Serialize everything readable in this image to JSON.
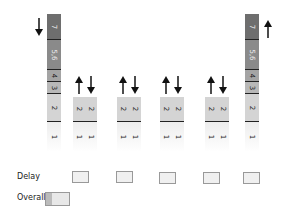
{
  "left_column": {
    "direction": "down",
    "segments": [
      {
        "label": "7",
        "color": "#6e6e6e",
        "top": 14,
        "height": 26
      },
      {
        "label": "5,6",
        "color": "#8a8a8a",
        "top": 40,
        "height": 30
      },
      {
        "label": "4",
        "color": "#a4a4a4",
        "top": 70,
        "height": 12
      },
      {
        "label": "3",
        "color": "#b8b8b8",
        "top": 82,
        "height": 12
      },
      {
        "label": "2",
        "color": "#d4d4d4",
        "top": 94,
        "height": 28
      },
      {
        "label": "1",
        "color": "#ededed",
        "top": 122,
        "height": 30
      }
    ]
  },
  "pairs": [
    {
      "x": 73,
      "labels_top": [
        "2",
        "2"
      ],
      "labels_bottom": [
        "1",
        "1"
      ]
    },
    {
      "x": 117,
      "labels_top": [
        "2",
        "2"
      ],
      "labels_bottom": [
        "1",
        "1"
      ]
    },
    {
      "x": 160,
      "labels_top": [
        "2",
        "2"
      ],
      "labels_bottom": [
        "1",
        "1"
      ]
    },
    {
      "x": 205,
      "labels_top": [
        "2",
        "2"
      ],
      "labels_bottom": [
        "1",
        "1"
      ]
    }
  ],
  "right_column": {
    "direction": "up",
    "segments": [
      {
        "label": "7",
        "color": "#6e6e6e",
        "top": 14,
        "height": 26
      },
      {
        "label": "5,6",
        "color": "#8a8a8a",
        "top": 40,
        "height": 30
      },
      {
        "label": "4",
        "color": "#a4a4a4",
        "top": 70,
        "height": 12
      },
      {
        "label": "3",
        "color": "#b8b8b8",
        "top": 82,
        "height": 12
      },
      {
        "label": "2",
        "color": "#d4d4d4",
        "top": 94,
        "height": 28
      },
      {
        "label": "1",
        "color": "#ededed",
        "top": 122,
        "height": 30
      }
    ]
  },
  "legend": {
    "delay_label": "Delay",
    "overall_label": "Overall"
  }
}
